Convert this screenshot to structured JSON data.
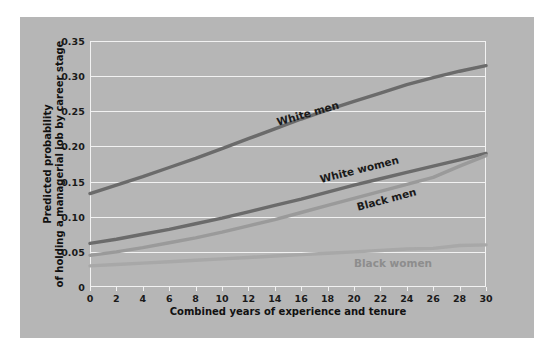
{
  "figure": {
    "background": "#ffffff",
    "panel_color": "#b6b6b6",
    "gridline_color": "#f2f2f2"
  },
  "chart_data": {
    "type": "line",
    "title": "",
    "xlabel": "Combined years of experience and tenure",
    "ylabel_line1": "Predicted probability",
    "ylabel_line2": "of holding a managerial job by career stage",
    "xlim": [
      0,
      30
    ],
    "ylim": [
      0,
      0.35
    ],
    "grid": "horizontal",
    "legend": "inline-labels",
    "xticks": [
      0,
      2,
      4,
      6,
      8,
      10,
      12,
      14,
      16,
      18,
      20,
      22,
      24,
      26,
      28,
      30
    ],
    "xtick_labels": [
      "0",
      "2",
      "4",
      "6",
      "8",
      "10",
      "12",
      "14",
      "16",
      "18",
      "20",
      "22",
      "24",
      "26",
      "28",
      "30"
    ],
    "yticks": [
      0,
      0.05,
      0.1,
      0.15,
      0.2,
      0.25,
      0.3,
      0.35
    ],
    "ytick_labels": [
      "0",
      "0.05",
      "0.10",
      "0.15",
      "0.20",
      "0.25",
      "0.30",
      "0.35"
    ],
    "x": [
      0,
      2,
      4,
      6,
      8,
      10,
      12,
      14,
      16,
      18,
      20,
      22,
      24,
      26,
      28,
      30
    ],
    "series": [
      {
        "name": "White men",
        "color": "#6b6b6b",
        "label_angle": -16,
        "values": [
          0.133,
          0.145,
          0.157,
          0.17,
          0.183,
          0.197,
          0.211,
          0.225,
          0.239,
          0.252,
          0.264,
          0.276,
          0.288,
          0.298,
          0.307,
          0.315
        ]
      },
      {
        "name": "White women",
        "color": "#6b6b6b",
        "label_angle": -14,
        "values": [
          0.062,
          0.068,
          0.075,
          0.082,
          0.09,
          0.098,
          0.107,
          0.116,
          0.125,
          0.135,
          0.145,
          0.154,
          0.163,
          0.172,
          0.181,
          0.19
        ]
      },
      {
        "name": "Black men",
        "color": "#9a9a9a",
        "label_angle": -15,
        "values": [
          0.045,
          0.05,
          0.056,
          0.063,
          0.07,
          0.078,
          0.087,
          0.096,
          0.106,
          0.116,
          0.126,
          0.136,
          0.146,
          0.156,
          0.172,
          0.187
        ]
      },
      {
        "name": "Black women",
        "color": "#a8a8a8",
        "label_angle": 0,
        "values": [
          0.03,
          0.032,
          0.034,
          0.036,
          0.038,
          0.04,
          0.042,
          0.044,
          0.046,
          0.048,
          0.05,
          0.052,
          0.054,
          0.055,
          0.059,
          0.06
        ]
      }
    ],
    "series_label_positions": [
      {
        "name": "White men",
        "x": 14.2,
        "y": 0.233,
        "color": "#1a1a1a"
      },
      {
        "name": "White women",
        "x": 17.4,
        "y": 0.152,
        "color": "#1a1a1a"
      },
      {
        "name": "Black men",
        "x": 20.2,
        "y": 0.113,
        "color": "#1a1a1a"
      },
      {
        "name": "Black women",
        "x": 20.0,
        "y": 0.033,
        "color": "#8d8d8d"
      }
    ]
  }
}
